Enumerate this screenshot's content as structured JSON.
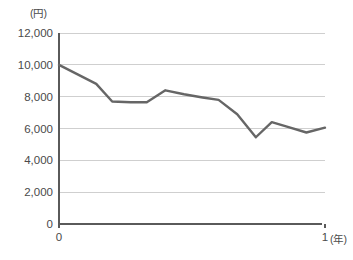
{
  "chart_data": {
    "type": "line",
    "title": "",
    "subtitle": "",
    "xlabel": "(年)",
    "ylabel": "(円)",
    "ylim": [
      0,
      12000
    ],
    "xlim": [
      0,
      1
    ],
    "grid": true,
    "legend": null,
    "legend_position": "none",
    "y_ticks": [
      0,
      2000,
      4000,
      6000,
      8000,
      10000,
      12000
    ],
    "y_tick_labels": [
      "0",
      "2,000",
      "4,000",
      "6,000",
      "8,000",
      "10,000",
      "12,000"
    ],
    "x_ticks": [
      0,
      1
    ],
    "x_tick_labels": [
      "0",
      "1"
    ],
    "line_color": "#666666",
    "grid_color": "#cfcfcf",
    "axis_color": "#5a5a5a",
    "x": [
      0.0,
      0.07,
      0.14,
      0.2,
      0.27,
      0.33,
      0.4,
      0.47,
      0.54,
      0.6,
      0.67,
      0.74,
      0.8,
      0.86,
      0.93,
      1.0
    ],
    "values": [
      10000,
      9400,
      8800,
      7700,
      7650,
      7650,
      8400,
      8150,
      7950,
      7800,
      6900,
      5450,
      6400,
      6100,
      5750,
      6050
    ],
    "series": [
      {
        "name": "",
        "values": [
          10000,
          9400,
          8800,
          7700,
          7650,
          7650,
          8400,
          8150,
          7950,
          7800,
          6900,
          5450,
          6400,
          6100,
          5750,
          6050
        ]
      }
    ],
    "annotations": []
  },
  "layout": {
    "plot_left": 59,
    "plot_right": 325,
    "plot_top": 33,
    "plot_bottom": 224,
    "x_axis_end": 322,
    "x_unit_label_x": 331,
    "x_unit_label_y": 243,
    "y_unit_label_x": 30,
    "y_unit_label_y": 17
  }
}
